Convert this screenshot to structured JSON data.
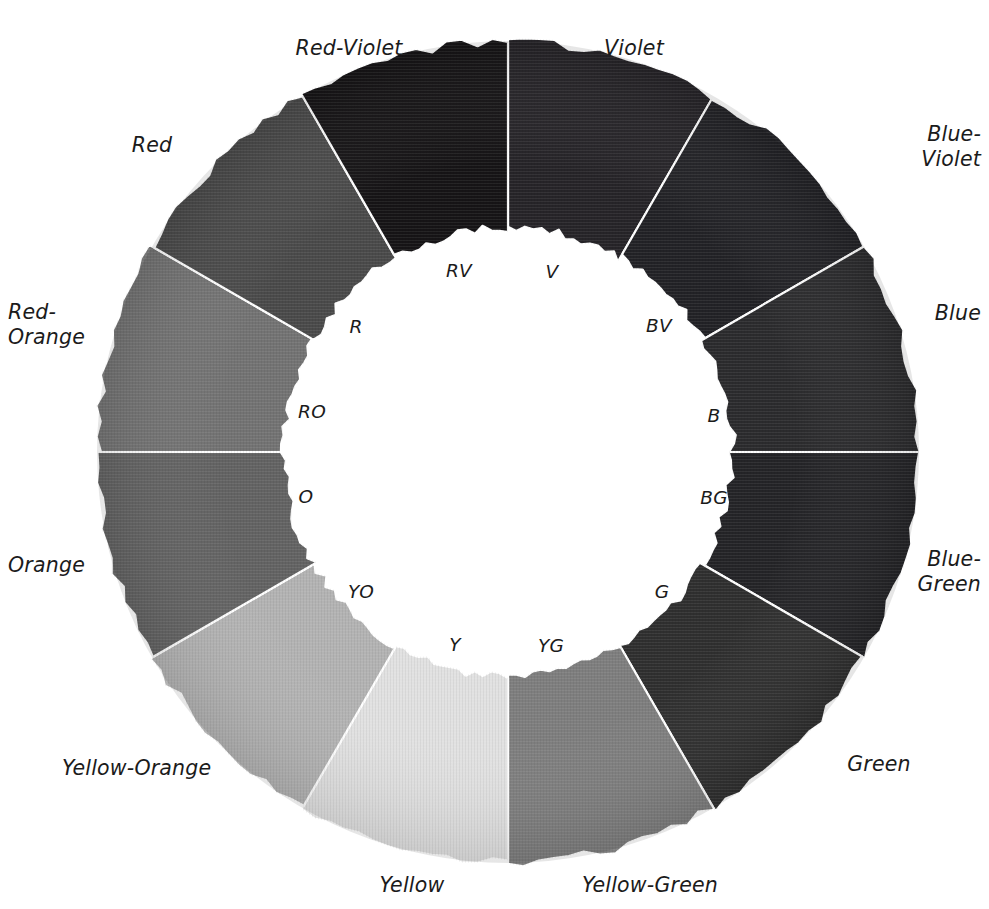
{
  "figure": {
    "background_color": "#ffffff",
    "text_color": "#1b1b1b",
    "segment_divider_color": "#ffffff"
  },
  "wheel": {
    "center_x": 508,
    "center_y": 452,
    "outer_radius": 411,
    "inner_radius": 224,
    "segment_count": 12,
    "segment_span_degrees": 30,
    "start_angle_degrees": -90,
    "note": "Value-scale (grayscale) rendering of a 12-hue color wheel; each wedge is a painted fabric swatch."
  },
  "chart_data": {
    "type": "pie",
    "subtype": "donut / color-wheel",
    "legend": "none",
    "grid": false,
    "categories": [
      "Violet",
      "Blue-Violet",
      "Blue",
      "Blue-Green",
      "Green",
      "Yellow-Green",
      "Yellow",
      "Yellow-Orange",
      "Orange",
      "Red-Orange",
      "Red",
      "Red-Violet"
    ],
    "values": [
      30,
      30,
      30,
      30,
      30,
      30,
      30,
      30,
      30,
      30,
      30,
      30
    ],
    "value_unit": "degrees",
    "colors": [
      "#262428",
      "#222226",
      "#2b2b2d",
      "#242427",
      "#2f2f2f",
      "#7e7e7e",
      "#e1e1e1",
      "#b3b3b3",
      "#636363",
      "#737373",
      "#4a4a4a",
      "#161416"
    ]
  },
  "segments": [
    {
      "index": 0,
      "abbrev": "V",
      "name": "Violet",
      "color": "#262428",
      "start_deg": -90,
      "end_deg": -60,
      "outer_label_pos": "top",
      "outer_label_x": 634,
      "outer_label_y": 48,
      "outer_align": "center",
      "inner_label_x": 552,
      "inner_label_y": 272
    },
    {
      "index": 1,
      "abbrev": "BV",
      "name": "Blue-Violet",
      "color": "#222226",
      "start_deg": -60,
      "end_deg": -30,
      "outer_label_pos": "upper-right",
      "outer_label_x": 981,
      "outer_label_y": 147,
      "outer_align": "right",
      "inner_label_x": 659,
      "inner_label_y": 326
    },
    {
      "index": 2,
      "abbrev": "B",
      "name": "Blue",
      "color": "#2b2b2d",
      "start_deg": -30,
      "end_deg": 0,
      "outer_label_pos": "right",
      "outer_label_x": 981,
      "outer_label_y": 313,
      "outer_align": "right",
      "inner_label_x": 714,
      "inner_label_y": 416
    },
    {
      "index": 3,
      "abbrev": "BG",
      "name": "Blue-\nGreen",
      "color": "#242427",
      "start_deg": 0,
      "end_deg": 30,
      "outer_label_pos": "right",
      "outer_label_x": 981,
      "outer_label_y": 572,
      "outer_align": "right",
      "inner_label_x": 714,
      "inner_label_y": 498
    },
    {
      "index": 4,
      "abbrev": "G",
      "name": "Green",
      "color": "#2f2f2f",
      "start_deg": 30,
      "end_deg": 60,
      "outer_label_pos": "lower-right",
      "outer_label_x": 879,
      "outer_label_y": 764,
      "outer_align": "center",
      "inner_label_x": 662,
      "inner_label_y": 592
    },
    {
      "index": 5,
      "abbrev": "YG",
      "name": "Yellow-Green",
      "color": "#7e7e7e",
      "start_deg": 60,
      "end_deg": 90,
      "outer_label_pos": "bottom",
      "outer_label_x": 650,
      "outer_label_y": 885,
      "outer_align": "center",
      "inner_label_x": 551,
      "inner_label_y": 646
    },
    {
      "index": 6,
      "abbrev": "Y",
      "name": "Yellow",
      "color": "#e1e1e1",
      "start_deg": 90,
      "end_deg": 120,
      "outer_label_pos": "bottom",
      "outer_label_x": 412,
      "outer_label_y": 885,
      "outer_align": "center",
      "inner_label_x": 455,
      "inner_label_y": 645
    },
    {
      "index": 7,
      "abbrev": "YO",
      "name": "Yellow-Orange",
      "color": "#b3b3b3",
      "start_deg": 120,
      "end_deg": 150,
      "outer_label_pos": "lower-left",
      "outer_label_x": 62,
      "outer_label_y": 768,
      "outer_align": "left",
      "inner_label_x": 361,
      "inner_label_y": 592
    },
    {
      "index": 8,
      "abbrev": "O",
      "name": "Orange",
      "color": "#636363",
      "start_deg": 150,
      "end_deg": 180,
      "outer_label_pos": "left",
      "outer_label_x": 8,
      "outer_label_y": 565,
      "outer_align": "left",
      "inner_label_x": 306,
      "inner_label_y": 497
    },
    {
      "index": 9,
      "abbrev": "RO",
      "name": "Red-\nOrange",
      "color": "#737373",
      "start_deg": 180,
      "end_deg": 210,
      "outer_label_pos": "left",
      "outer_label_x": 8,
      "outer_label_y": 325,
      "outer_align": "left",
      "inner_label_x": 312,
      "inner_label_y": 412
    },
    {
      "index": 10,
      "abbrev": "R",
      "name": "Red",
      "color": "#4a4a4a",
      "start_deg": 210,
      "end_deg": 240,
      "outer_label_pos": "upper-left",
      "outer_label_x": 152,
      "outer_label_y": 145,
      "outer_align": "center",
      "inner_label_x": 356,
      "inner_label_y": 327
    },
    {
      "index": 11,
      "abbrev": "RV",
      "name": "Red-Violet",
      "color": "#161416",
      "start_deg": 240,
      "end_deg": 270,
      "outer_label_pos": "top",
      "outer_label_x": 349,
      "outer_label_y": 48,
      "outer_align": "center",
      "inner_label_x": 459,
      "inner_label_y": 271
    }
  ]
}
